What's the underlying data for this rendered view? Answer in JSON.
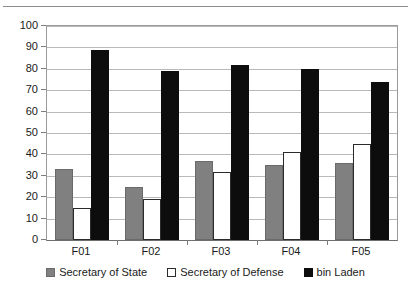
{
  "chart_data": {
    "type": "bar",
    "title": "",
    "subtitle": "",
    "xlabel": "",
    "ylabel": "",
    "categories": [
      "F01",
      "F02",
      "F03",
      "F04",
      "F05"
    ],
    "series": [
      {
        "name": "Secretary of State",
        "color": "#808080",
        "values": [
          33,
          25,
          37,
          35,
          36
        ]
      },
      {
        "name": "Secretary of Defense",
        "color": "#ffffff",
        "values": [
          15,
          19,
          32,
          41,
          45
        ]
      },
      {
        "name": "bin Laden",
        "color": "#0d0d0d",
        "values": [
          89,
          79,
          82,
          80,
          74
        ]
      }
    ],
    "ylim": [
      0,
      100
    ],
    "ytick_step": 10,
    "yticks": [
      0,
      10,
      20,
      30,
      40,
      50,
      60,
      70,
      80,
      90,
      100
    ],
    "ytick_labels": [
      "0",
      "10",
      "20",
      "30",
      "40",
      "50",
      "60",
      "70",
      "80",
      "90",
      "100"
    ],
    "grid": true,
    "grid_axis": "y",
    "legend_position": "bottom",
    "bar_layout": "grouped"
  }
}
